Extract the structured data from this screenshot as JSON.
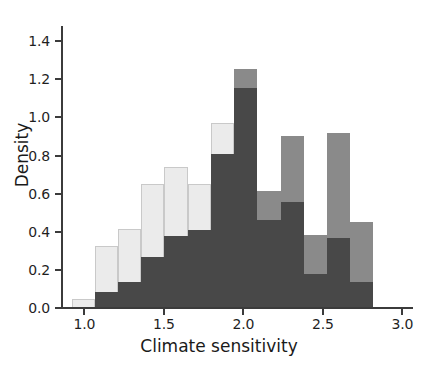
{
  "chart_data": {
    "type": "bar",
    "title": "",
    "subtitle": "",
    "xlabel": "Climate sensitivity",
    "ylabel": "Density",
    "xlim": [
      0.86,
      3.06
    ],
    "ylim": [
      0.0,
      1.48
    ],
    "xticks": [
      "1.0",
      "1.5",
      "2.0",
      "2.5",
      "3.0"
    ],
    "xtick_values": [
      1.0,
      1.5,
      2.0,
      2.5,
      3.0
    ],
    "yticks": [
      "0.0",
      "0.2",
      "0.4",
      "0.6",
      "0.8",
      "1.0",
      "1.2",
      "1.4"
    ],
    "ytick_values": [
      0.0,
      0.2,
      0.4,
      0.6,
      0.8,
      1.0,
      1.2,
      1.4
    ],
    "grid": false,
    "legend": "none",
    "bin_edges": [
      0.92,
      1.066,
      1.212,
      1.358,
      1.504,
      1.65,
      1.796,
      1.942,
      2.088,
      2.234,
      2.38,
      2.526,
      2.672,
      2.818
    ],
    "bin_centers": [
      0.993,
      1.139,
      1.285,
      1.431,
      1.577,
      1.723,
      1.869,
      2.015,
      2.161,
      2.307,
      2.453,
      2.599,
      2.745
    ],
    "series": [
      {
        "name": "light",
        "color": "#ebebeb",
        "edgecolor": "#c9c9c9",
        "values": [
          0.045,
          0.325,
          0.415,
          0.65,
          0.74,
          0.65,
          0.97,
          1.255,
          0.615,
          0.905,
          0.385,
          0.92,
          0.45
        ]
      },
      {
        "name": "medium",
        "color": "#8a8a8a",
        "edgecolor": "#8a8a8a",
        "values": [
          0.0,
          0.0,
          0.0,
          0.0,
          0.0,
          0.0,
          0.0,
          1.255,
          0.615,
          0.905,
          0.385,
          0.92,
          0.45
        ]
      },
      {
        "name": "dark",
        "color": "#484848",
        "edgecolor": "#484848",
        "values": [
          0.0,
          0.085,
          0.135,
          0.268,
          0.38,
          0.41,
          0.808,
          1.155,
          0.46,
          0.555,
          0.18,
          0.368,
          0.138
        ]
      }
    ]
  }
}
